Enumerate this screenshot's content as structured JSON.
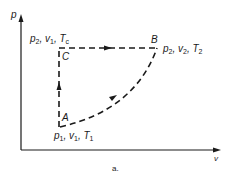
{
  "diagram": {
    "type": "p-v process diagram",
    "caption": "a.",
    "axes": {
      "y_label": "p",
      "x_label": "v"
    },
    "points": {
      "A": {
        "label": "A",
        "state": {
          "p": "p",
          "p_sub": "1",
          "v": "v",
          "v_sub": "1",
          "T": "T",
          "T_sub": "1"
        }
      },
      "B": {
        "label": "B",
        "state": {
          "p": "p",
          "p_sub": "2",
          "v": "v",
          "v_sub": "2",
          "T": "T",
          "T_sub": "2"
        }
      },
      "C": {
        "label": "C",
        "state": {
          "p": "p",
          "p_sub": "2",
          "v": "v",
          "v_sub": "1",
          "T": "T",
          "T_sub": "c"
        }
      }
    },
    "paths": [
      {
        "from": "A",
        "to": "C",
        "style": "dashed",
        "shape": "vertical line",
        "arrow": "up"
      },
      {
        "from": "C",
        "to": "B",
        "style": "dashed",
        "shape": "horizontal line",
        "arrow": "right"
      },
      {
        "from": "A",
        "to": "B",
        "style": "dashed",
        "shape": "concave-up curve",
        "arrow": "toward B"
      }
    ],
    "colors": {
      "ink": "#1a1a1a",
      "background": "#ffffff"
    }
  }
}
